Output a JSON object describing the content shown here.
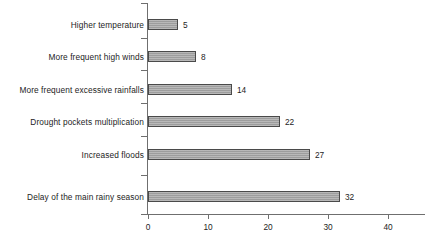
{
  "chart_data": {
    "type": "bar",
    "orientation": "horizontal",
    "title": "",
    "subtitle": "",
    "xlabel": "",
    "ylabel": "",
    "categories": [
      "Higher temperature",
      "More frequent high winds",
      "More frequent excessive rainfalls",
      "Drought pockets multiplication",
      "Increased floods",
      "Delay of the main rainy season"
    ],
    "values": [
      5,
      8,
      14,
      22,
      27,
      32
    ],
    "value_labels": [
      "5",
      "8",
      "14",
      "22",
      "27",
      "32"
    ],
    "xticks": [
      0,
      10,
      20,
      30,
      40
    ],
    "xtick_labels": [
      "0",
      "10",
      "20",
      "30",
      "40"
    ],
    "xlim": [
      0,
      46
    ],
    "grid": false,
    "legend": null,
    "legend_position": "none",
    "series": [
      {
        "name": "",
        "values": [
          5,
          8,
          14,
          22,
          27,
          32
        ]
      }
    ],
    "colors": {
      "bar_fill": "#a5a5a5",
      "bar_border": "#4a4a4a",
      "axis": "#6f6f6f",
      "text": "#1d1d1d",
      "background": "#ffffff"
    }
  }
}
